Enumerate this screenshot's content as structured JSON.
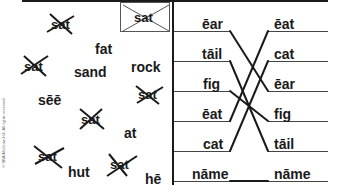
{
  "worksheet": {
    "copyright": "© SRA/McGraw-Hill. All rights reserved.",
    "example_box_word": "sat",
    "left_panel": {
      "words": [
        {
          "text": "sat",
          "crossed": true
        },
        {
          "text": "fat",
          "crossed": false
        },
        {
          "text": "sat",
          "crossed": true
        },
        {
          "text": "sand",
          "crossed": false
        },
        {
          "text": "rock",
          "crossed": false
        },
        {
          "text": "sēē",
          "crossed": false
        },
        {
          "text": "sat",
          "crossed": true
        },
        {
          "text": "sat",
          "crossed": true
        },
        {
          "text": "at",
          "crossed": false
        },
        {
          "text": "sat",
          "crossed": true
        },
        {
          "text": "hut",
          "crossed": false
        },
        {
          "text": "sat",
          "crossed": true
        },
        {
          "text": "hē",
          "crossed": false
        }
      ]
    },
    "matching": {
      "left_column": [
        "ēar",
        "tāil",
        "fig",
        "ēat",
        "cat",
        "nāme"
      ],
      "right_column": [
        "ēat",
        "cat",
        "ēar",
        "fig",
        "tāil",
        "nāme"
      ],
      "connections": [
        {
          "from": "ēar",
          "to": "ēar"
        },
        {
          "from": "tāil",
          "to": "tāil"
        },
        {
          "from": "fig",
          "to": "fig"
        },
        {
          "from": "ēat",
          "to": "ēat"
        },
        {
          "from": "cat",
          "to": "cat"
        },
        {
          "from": "nāme",
          "to": "nāme"
        }
      ]
    }
  }
}
